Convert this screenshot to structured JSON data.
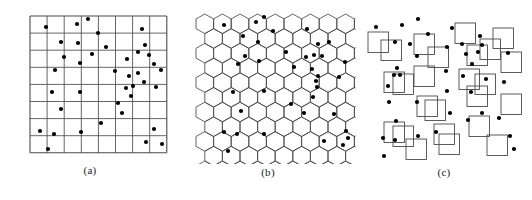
{
  "figure": {
    "width": 532,
    "height": 200,
    "background": "#ffffff",
    "line_color": "#4a4a4a",
    "point_color": "#000000",
    "point_radius": 2.1,
    "panels": [
      {
        "id": "a",
        "caption": "(a)",
        "type": "square-grid-point-pattern",
        "origin_x": 30,
        "origin_y": 16,
        "cols": 8,
        "rows": 8,
        "cell_size": 17.1,
        "caption_x": 98,
        "caption_y": 166
      },
      {
        "id": "b",
        "caption": "(b)",
        "type": "hexagonal-grid-point-pattern",
        "origin_x": 196,
        "origin_y": 14,
        "hex_width": 17.6,
        "hex_height": 19.6,
        "cols": 9,
        "rows": 9,
        "caption_x": 270,
        "caption_y": 168
      },
      {
        "id": "c",
        "caption": "(c)",
        "type": "random-square-quadrats-point-pattern",
        "origin_x": 362,
        "origin_y": 14,
        "square_size": 20.5,
        "caption_x": 436,
        "caption_y": 168
      }
    ]
  },
  "chart_data": {
    "type": "scatter",
    "title": "",
    "xlabel": "",
    "ylabel": "",
    "xlim": [
      0,
      137
    ],
    "ylim": [
      0,
      144
    ],
    "grid": true,
    "legend": "none",
    "series": [
      {
        "name": "points-panel-a",
        "panel": "a",
        "n": 52,
        "points": [
          [
            16,
            11
          ],
          [
            47,
            8
          ],
          [
            58,
            3
          ],
          [
            68,
            17
          ],
          [
            112,
            13
          ],
          [
            31,
            26
          ],
          [
            48,
            27
          ],
          [
            76,
            31
          ],
          [
            115,
            29
          ],
          [
            97,
            43
          ],
          [
            108,
            36
          ],
          [
            119,
            39
          ],
          [
            34,
            41
          ],
          [
            62,
            38
          ],
          [
            50,
            47
          ],
          [
            124,
            48
          ],
          [
            25,
            54
          ],
          [
            85,
            55
          ],
          [
            99,
            60
          ],
          [
            108,
            57
          ],
          [
            131,
            54
          ],
          [
            103,
            70
          ],
          [
            114,
            66
          ],
          [
            96,
            72
          ],
          [
            22,
            76
          ],
          [
            50,
            76
          ],
          [
            126,
            71
          ],
          [
            101,
            80
          ],
          [
            88,
            87
          ],
          [
            31,
            93
          ],
          [
            92,
            97
          ],
          [
            71,
            107
          ],
          [
            10,
            115
          ],
          [
            24,
            118
          ],
          [
            51,
            116
          ],
          [
            124,
            113
          ],
          [
            116,
            126
          ],
          [
            132,
            128
          ],
          [
            18,
            133
          ]
        ]
      },
      {
        "name": "points-panel-b",
        "panel": "b",
        "n": 52,
        "points": [
          [
            28,
            11
          ],
          [
            60,
            8
          ],
          [
            68,
            3
          ],
          [
            47,
            22
          ],
          [
            77,
            17
          ],
          [
            62,
            28
          ],
          [
            111,
            15
          ],
          [
            122,
            30
          ],
          [
            133,
            28
          ],
          [
            90,
            38
          ],
          [
            49,
            42
          ],
          [
            110,
            43
          ],
          [
            118,
            41
          ],
          [
            126,
            42
          ],
          [
            42,
            50
          ],
          [
            63,
            47
          ],
          [
            98,
            53
          ],
          [
            116,
            55
          ],
          [
            122,
            62
          ],
          [
            149,
            48
          ],
          [
            120,
            67
          ],
          [
            121,
            73
          ],
          [
            143,
            63
          ],
          [
            117,
            83
          ],
          [
            37,
            78
          ],
          [
            68,
            77
          ],
          [
            95,
            90
          ],
          [
            45,
            97
          ],
          [
            108,
            99
          ],
          [
            28,
            118
          ],
          [
            41,
            120
          ],
          [
            68,
            120
          ],
          [
            138,
            100
          ],
          [
            150,
            117
          ],
          [
            32,
            137
          ],
          [
            128,
            127
          ],
          [
            147,
            131
          ],
          [
            152,
            124
          ]
        ]
      },
      {
        "name": "points-panel-c",
        "panel": "c",
        "n": 52,
        "points": [
          [
            14,
            13
          ],
          [
            40,
            11
          ],
          [
            56,
            5
          ],
          [
            33,
            28
          ],
          [
            48,
            30
          ],
          [
            66,
            20
          ],
          [
            85,
            33
          ],
          [
            90,
            14
          ],
          [
            100,
            30
          ],
          [
            118,
            22
          ],
          [
            120,
            31
          ],
          [
            55,
            42
          ],
          [
            35,
            54
          ],
          [
            38,
            61
          ],
          [
            104,
            40
          ],
          [
            110,
            50
          ],
          [
            116,
            38
          ],
          [
            146,
            39
          ],
          [
            84,
            57
          ],
          [
            101,
            62
          ],
          [
            26,
            72
          ],
          [
            32,
            61
          ],
          [
            55,
            88
          ],
          [
            85,
            77
          ],
          [
            109,
            78
          ],
          [
            124,
            65
          ],
          [
            142,
            68
          ],
          [
            27,
            88
          ],
          [
            88,
            99
          ],
          [
            34,
            107
          ],
          [
            21,
            124
          ],
          [
            33,
            126
          ],
          [
            56,
            122
          ],
          [
            74,
            118
          ],
          [
            106,
            106
          ],
          [
            120,
            99
          ],
          [
            137,
            104
          ],
          [
            22,
            142
          ],
          [
            148,
            122
          ],
          [
            152,
            135
          ]
        ]
      }
    ]
  }
}
